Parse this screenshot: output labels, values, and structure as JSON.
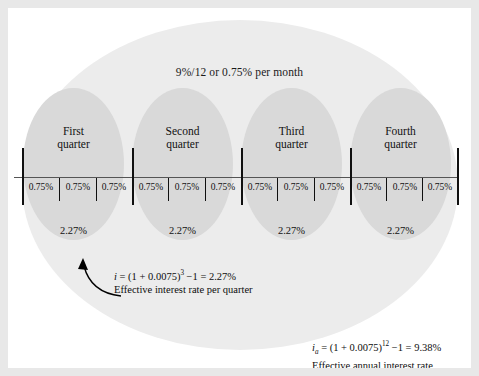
{
  "diagram": {
    "title_label": "9%/12 or 0.75% per month",
    "nominal_rate": "9%",
    "compounding_periods_per_year": 12,
    "monthly_rate_label": "0.75%",
    "quarters": [
      {
        "name_line1": "First",
        "name_line2": "quarter",
        "effective_rate": "2.27%",
        "months": [
          "0.75%",
          "0.75%",
          "0.75%"
        ]
      },
      {
        "name_line1": "Second",
        "name_line2": "quarter",
        "effective_rate": "2.27%",
        "months": [
          "0.75%",
          "0.75%",
          "0.75%"
        ]
      },
      {
        "name_line1": "Third",
        "name_line2": "quarter",
        "effective_rate": "2.27%",
        "months": [
          "0.75%",
          "0.75%",
          "0.75%"
        ]
      },
      {
        "name_line1": "Fourth",
        "name_line2": "quarter",
        "effective_rate": "2.27%",
        "months": [
          "0.75%",
          "0.75%",
          "0.75%"
        ]
      }
    ],
    "quarter_callout": {
      "symbol": "i",
      "formula_head": " = (1 + 0.0075)",
      "exponent": "3",
      "formula_tail": " −1 = 2.27%",
      "description": "Effective interest rate per quarter"
    },
    "annual_callout": {
      "symbol": "i",
      "subscript": "a",
      "formula_head": " = (1 + 0.0075)",
      "exponent": "12",
      "formula_tail": " −1 = 9.38%",
      "description": "Effective annual interest rate"
    },
    "colors": {
      "frame": "#e8e8e8",
      "canvas": "#ffffff",
      "outer_ellipse": "#ececec",
      "quarter_ellipse": "#d9d9d9",
      "ink": "#111111"
    }
  }
}
